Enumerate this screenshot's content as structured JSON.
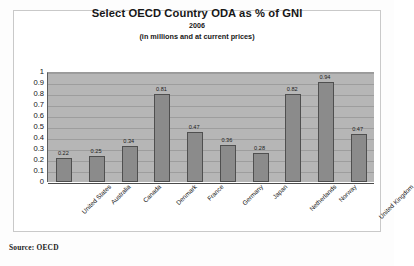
{
  "figure": {
    "title": "Select OECD Country ODA as % of GNI",
    "subtitle": "2006",
    "note": "(in millions and at current prices)",
    "source_note": "Source: OECD"
  },
  "style": {
    "bar_color": "#8b8b8b",
    "bar_border_color": "#4f4f4f",
    "plot_background": "#b6b6b6",
    "gridline_color": "#9d9d9d",
    "text_color": "#171717",
    "frame_color": "#c9c9c9"
  },
  "chart_data": {
    "type": "bar",
    "title": "Select OECD Country ODA as % of GNI",
    "subtitle": "2006",
    "annotations": [
      "(in millions and at current prices)",
      "Source: OECD"
    ],
    "xlabel": "",
    "ylabel": "",
    "ylim": [
      0,
      1
    ],
    "ytick_step": 0.1,
    "grid": true,
    "legend": false,
    "yticks": [
      "1",
      "0.9",
      "0.8",
      "0.7",
      "0.6",
      "0.5",
      "0.4",
      "0.3",
      "0.2",
      "0.1",
      "0"
    ],
    "categories": [
      "United States",
      "Australia",
      "Canada",
      "Denmark",
      "France",
      "Germany",
      "Japan",
      "Netherlands",
      "Norway",
      "United Kingdom"
    ],
    "values": [
      0.22,
      0.25,
      0.34,
      0.81,
      0.47,
      0.36,
      0.28,
      0.82,
      0.94,
      0.47
    ],
    "data_labels": [
      "0.22",
      "0.25",
      "0.34",
      "0.81",
      "0.47",
      "0.36",
      "0.28",
      "0.82",
      "0.94",
      "0.47"
    ],
    "bar_tops": [
      0.215,
      0.24,
      0.325,
      0.8,
      0.455,
      0.34,
      0.26,
      0.8,
      0.91,
      0.44
    ]
  }
}
